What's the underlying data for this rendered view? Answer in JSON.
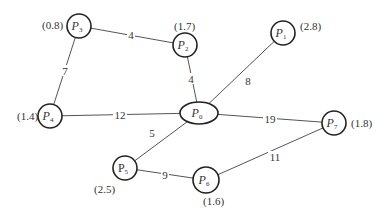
{
  "diagram": {
    "type": "weighted-graph",
    "nodes": [
      {
        "id": "P0",
        "prefix": "P",
        "sub": "0",
        "weight": "",
        "cx": 199,
        "cy": 113,
        "rx": 19,
        "ry": 11,
        "shape": "ellipse",
        "italic": true
      },
      {
        "id": "P1",
        "prefix": "P",
        "sub": "1",
        "weight": "(2.8)",
        "cx": 283,
        "cy": 33,
        "r": 12,
        "italic": true,
        "wx": 300,
        "wy": 30
      },
      {
        "id": "P2",
        "prefix": "P",
        "sub": "2",
        "weight": "(1.7)",
        "cx": 185,
        "cy": 45,
        "r": 12,
        "italic": true,
        "wx": 174,
        "wy": 30
      },
      {
        "id": "P3",
        "prefix": "P",
        "sub": "3",
        "weight": "(0.8)",
        "cx": 79,
        "cy": 26,
        "r": 12,
        "italic": true,
        "wx": 42,
        "wy": 29
      },
      {
        "id": "P4",
        "prefix": "P",
        "sub": "4",
        "weight": "(1.4)",
        "cx": 50,
        "cy": 116,
        "r": 12,
        "italic": true,
        "wx": 17,
        "wy": 120
      },
      {
        "id": "P5",
        "prefix": "P",
        "sub": "5",
        "weight": "(2.5)",
        "cx": 125,
        "cy": 168,
        "r": 12,
        "italic": false,
        "wx": 94,
        "wy": 193
      },
      {
        "id": "P6",
        "prefix": "P",
        "sub": "6",
        "weight": "(1.6)",
        "cx": 206,
        "cy": 180,
        "r": 13,
        "italic": true,
        "wx": 203,
        "wy": 205
      },
      {
        "id": "P7",
        "prefix": "P",
        "sub": "7",
        "weight": "(1.8)",
        "cx": 334,
        "cy": 123,
        "r": 12,
        "italic": true,
        "wx": 351,
        "wy": 127
      }
    ],
    "edges": [
      {
        "from": "P3",
        "to": "P2",
        "label": "4",
        "lx": 131,
        "ly": 35
      },
      {
        "from": "P3",
        "to": "P4",
        "label": "7",
        "lx": 65,
        "ly": 71
      },
      {
        "from": "P2",
        "to": "P0",
        "label": "4",
        "lx": 191,
        "ly": 79
      },
      {
        "from": "P1",
        "to": "P0",
        "label": "8",
        "lx": 248,
        "ly": 81
      },
      {
        "from": "P4",
        "to": "P0",
        "label": "12",
        "lx": 120,
        "ly": 115
      },
      {
        "from": "P0",
        "to": "P5",
        "label": "5",
        "lx": 152,
        "ly": 133
      },
      {
        "from": "P0",
        "to": "P7",
        "label": "19",
        "lx": 270,
        "ly": 119
      },
      {
        "from": "P5",
        "to": "P6",
        "label": "9",
        "lx": 165,
        "ly": 175
      },
      {
        "from": "P6",
        "to": "P7",
        "label": "11",
        "lx": 275,
        "ly": 157
      }
    ]
  }
}
